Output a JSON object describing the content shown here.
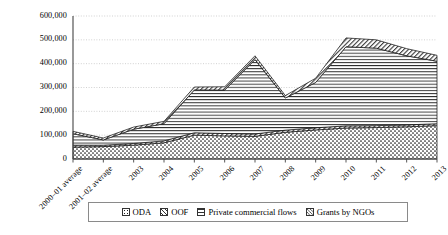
{
  "chart_data": {
    "type": "area",
    "stacked": true,
    "title": "",
    "xlabel": "",
    "ylabel": "",
    "ylim": [
      0,
      600000
    ],
    "ytick_step": 100000,
    "grid": true,
    "legend_position": "bottom",
    "categories": [
      "2000–01 average",
      "2001–02 average",
      "2003",
      "2004",
      "2005",
      "2006",
      "2007",
      "2008",
      "2009",
      "2010",
      "2011",
      "2012",
      "2013"
    ],
    "ytick_labels": [
      "0",
      "100,000",
      "200,000",
      "300,000",
      "400,000",
      "500,000",
      "600,000"
    ],
    "ytick_values": [
      0,
      100000,
      200000,
      300000,
      400000,
      500000,
      600000
    ],
    "series": [
      {
        "name": "ODA",
        "pattern": "dots",
        "values": [
          50000,
          52000,
          58000,
          68000,
          100000,
          97000,
          95000,
          112000,
          122000,
          130000,
          132000,
          135000,
          140000
        ]
      },
      {
        "name": "OOF",
        "pattern": "diagonal-thin",
        "values": [
          8000,
          6000,
          7000,
          8000,
          10000,
          10000,
          10000,
          9000,
          9000,
          9000,
          8000,
          8000,
          8000
        ]
      },
      {
        "name": "Private commercial flows",
        "pattern": "horizontal-lines",
        "values": [
          48000,
          22000,
          60000,
          72000,
          180000,
          182000,
          312000,
          135000,
          190000,
          332000,
          325000,
          290000,
          262000
        ]
      },
      {
        "name": "Grants by NGOs",
        "pattern": "diagonal-thin",
        "values": [
          10000,
          8000,
          9000,
          10000,
          12000,
          14000,
          16000,
          10000,
          18000,
          37000,
          35000,
          30000,
          25000
        ]
      }
    ],
    "totals": [
      116000,
      88000,
      134000,
      158000,
      302000,
      303000,
      433000,
      266000,
      339000,
      508000,
      500000,
      463000,
      435000
    ]
  },
  "legend": {
    "items": [
      {
        "label": "ODA",
        "swatch": "oda-swatch-icon"
      },
      {
        "label": "OOF",
        "swatch": "oof-swatch-icon"
      },
      {
        "label": "Private commercial flows",
        "swatch": "private-commercial-flows-swatch-icon"
      },
      {
        "label": "Grants by NGOs",
        "swatch": "grants-by-ngos-swatch-icon"
      }
    ]
  }
}
